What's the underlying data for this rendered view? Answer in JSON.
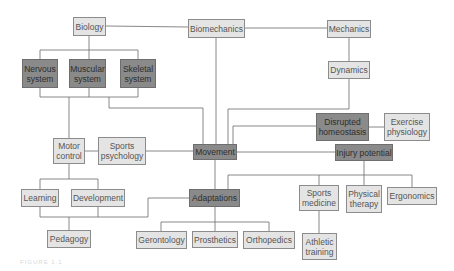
{
  "diagram": {
    "colors": {
      "light_box": "#e4e4e4",
      "dark_box": "#8a8a8a",
      "line": "#6a6a6a",
      "text": "#555555"
    },
    "nodes": {
      "biology": "Biology",
      "biomechanics": "Biomechanics",
      "mechanics": "Mechanics",
      "nervous_system": "Nervous system",
      "muscular_system": "Muscular system",
      "skeletal_system": "Skeletal system",
      "dynamics": "Dynamics",
      "disrupted_homeostasis": "Disrupted homeostasis",
      "exercise_physiology": "Exercise physiology",
      "motor_control": "Motor control",
      "sports_psychology": "Sports psychology",
      "movement": "Movement",
      "injury_potential": "Injury potential",
      "learning": "Learning",
      "development": "Development",
      "adaptations": "Adaptations",
      "sports_medicine": "Sports medicine",
      "physical_therapy": "Physical therapy",
      "ergonomics": "Ergonomics",
      "pedagogy": "Pedagogy",
      "gerontology": "Gerontology",
      "prosthetics": "Prosthetics",
      "orthopedics": "Orthopedics",
      "athletic_training": "Athletic training"
    },
    "caption": "FIGURE 1.1"
  }
}
